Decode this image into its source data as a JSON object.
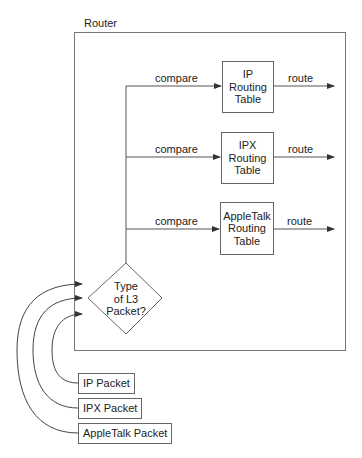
{
  "router": {
    "label": "Router"
  },
  "decision": {
    "lines": [
      "Type",
      "of L3",
      "Packet?"
    ]
  },
  "routing_tables": [
    {
      "lines": [
        "IP",
        "Routing",
        "Table"
      ],
      "input_label": "compare",
      "output_label": "route"
    },
    {
      "lines": [
        "IPX",
        "Routing",
        "Table"
      ],
      "input_label": "compare",
      "output_label": "route"
    },
    {
      "lines": [
        "AppleTalk",
        "Routing",
        "Table"
      ],
      "input_label": "compare",
      "output_label": "route"
    }
  ],
  "packets": [
    {
      "label": "IP Packet"
    },
    {
      "label": "IPX Packet"
    },
    {
      "label": "AppleTalk Packet"
    }
  ],
  "colors": {
    "line": "#555555",
    "box_border": "#666666",
    "text": "#222222"
  }
}
